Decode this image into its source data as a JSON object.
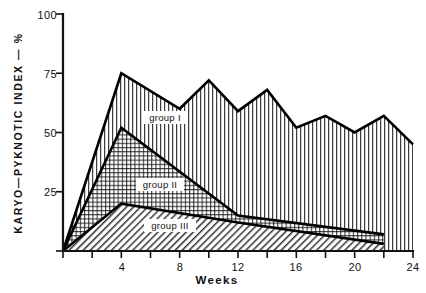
{
  "chart_data": {
    "type": "area",
    "title": "",
    "subtitle": "",
    "xlabel": "Weeks",
    "ylabel": "KARYO—PYKNOTIC  INDEX  —  %",
    "xlim": [
      0,
      24
    ],
    "ylim": [
      0,
      100
    ],
    "xticks": [
      0,
      4,
      8,
      12,
      16,
      20,
      24
    ],
    "xticklabels": [
      "",
      "4",
      "8",
      "12",
      "16",
      "20",
      "24"
    ],
    "yticks": [
      0,
      25,
      50,
      75,
      100
    ],
    "yticklabels": [
      "",
      "25",
      "50",
      "75",
      "100"
    ],
    "grid": false,
    "legend_position": "inline-on-bands",
    "series": [
      {
        "name": "group I",
        "label": "group I",
        "fill_pattern": "vertical-lines",
        "x": [
          0,
          4,
          8,
          10,
          12,
          14,
          16,
          18,
          20,
          22,
          24
        ],
        "y": [
          0,
          75,
          60,
          72,
          59,
          68,
          52,
          57,
          50,
          57,
          45
        ]
      },
      {
        "name": "group II",
        "label": "group II",
        "fill_pattern": "cross-hatch-grid",
        "x": [
          0,
          4,
          12,
          22
        ],
        "y": [
          0,
          52,
          15,
          7
        ]
      },
      {
        "name": "group III",
        "label": "group III",
        "fill_pattern": "diagonal-hatch",
        "x": [
          0,
          4,
          12,
          22
        ],
        "y": [
          0,
          20,
          12,
          3
        ]
      }
    ]
  },
  "axes": {
    "y_title": "KARYO—PYKNOTIC  INDEX  —  %",
    "x_title": "Weeks",
    "y_tick_100": "100",
    "y_tick_75": "75",
    "y_tick_50": "50",
    "y_tick_25": "25",
    "x_tick_4": "4",
    "x_tick_8": "8",
    "x_tick_12": "12",
    "x_tick_16": "16",
    "x_tick_20": "20",
    "x_tick_24": "24"
  },
  "series_labels": {
    "group1": "group I",
    "group2": "group II",
    "group3": "group III"
  },
  "colors": {
    "ink": "#111111",
    "line": "#000000",
    "background": "#ffffff"
  }
}
